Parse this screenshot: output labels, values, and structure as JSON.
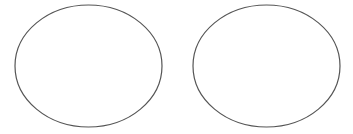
{
  "canvas": {
    "width": 353,
    "height": 134,
    "background": "#ffffff"
  },
  "stroke": {
    "color": "#555555",
    "width": 1.2
  },
  "shapes": [
    {
      "type": "ellipse",
      "name": "left-ellipse",
      "cx": 88.5,
      "cy": 66,
      "rx": 73.5,
      "ry": 61,
      "fill": "#ffffff"
    },
    {
      "type": "ellipse",
      "name": "right-ellipse",
      "cx": 266.5,
      "cy": 66,
      "rx": 73.5,
      "ry": 61,
      "fill": "#ffffff"
    }
  ]
}
